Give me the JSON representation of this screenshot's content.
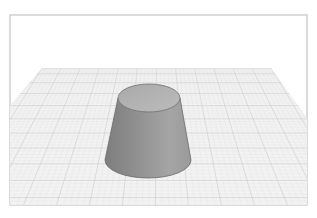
{
  "viewport": {
    "width": 317,
    "height": 218,
    "background": "#ffffff",
    "frame": {
      "x": 10,
      "y": 15,
      "w": 297,
      "h": 190,
      "stroke": "#c4c4c4"
    }
  },
  "ground_plane": {
    "fill": "#f3f3f3",
    "minor_grid_color": "#e2e2e2",
    "major_grid_color": "#cfcfcf",
    "far_left": [
      42,
      68
    ],
    "far_right": [
      271,
      68
    ],
    "near_left_edge_y": 100,
    "near_right_edge_y": 107
  },
  "object": {
    "type": "truncated-cone",
    "top_ellipse": {
      "cx": 149,
      "cy": 98,
      "rx": 31,
      "ry": 14,
      "fill": "#b3b3b3"
    },
    "bottom_ellipse": {
      "cx": 148,
      "cy": 160,
      "rx": 43,
      "ry": 18
    },
    "side_fill_dark": "#8a8a8a",
    "side_fill_light": "#a2a2a2",
    "outline": "#6a6a6a"
  }
}
